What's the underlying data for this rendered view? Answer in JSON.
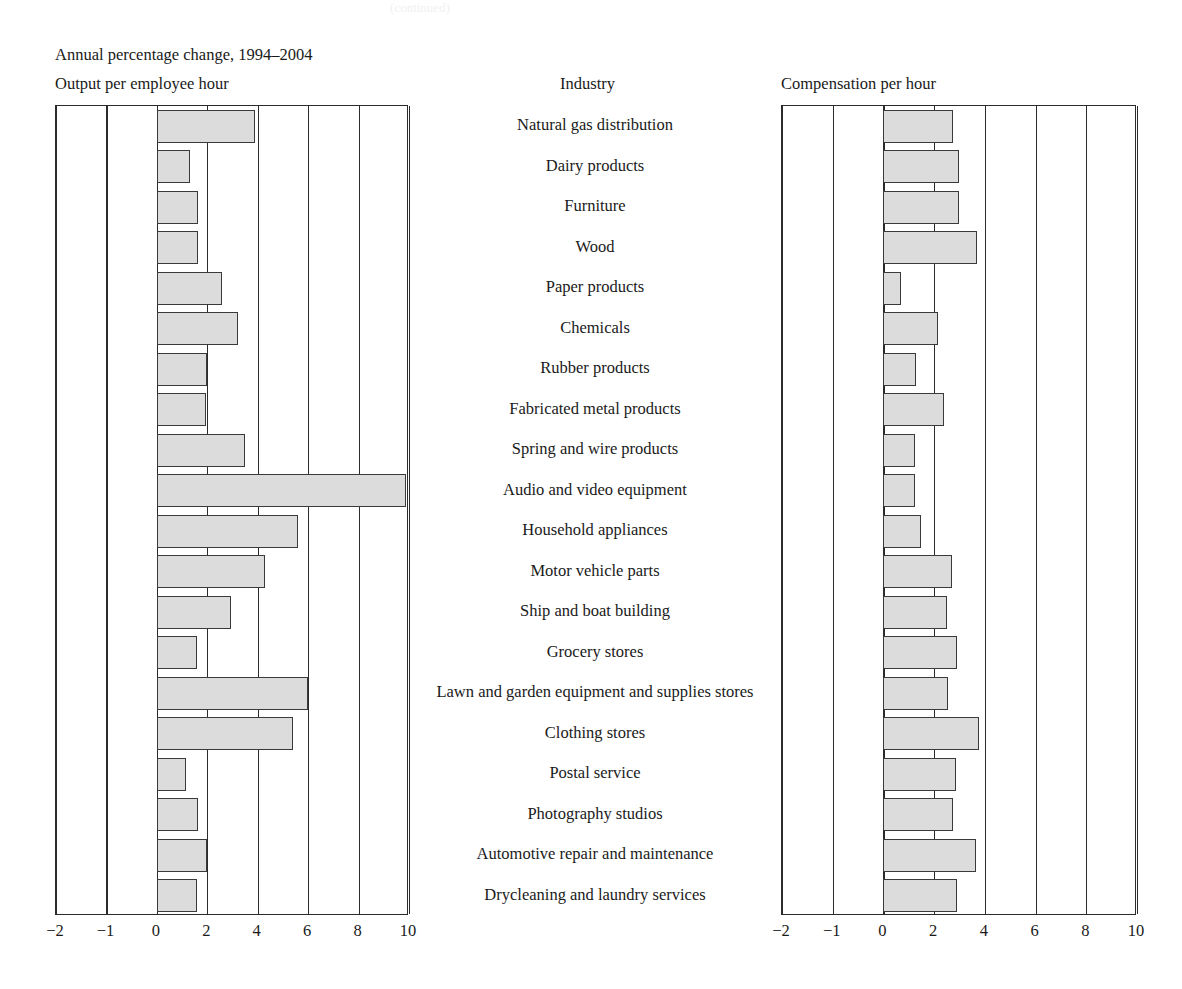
{
  "top_cut_text": "(continued)",
  "headings": {
    "subtitle": "Annual percentage change, 1994–2004",
    "left_column": "Output per employee hour",
    "middle_column": "Industry",
    "right_column": "Compensation per hour"
  },
  "axis": {
    "ticks": [
      "−2",
      "−1",
      "0",
      "2",
      "4",
      "6",
      "8",
      "10"
    ],
    "tick_values": [
      -2,
      -1,
      0,
      2,
      4,
      6,
      8,
      10
    ],
    "min": -2,
    "max": 10
  },
  "style": {
    "bar_fill": "#dcdcdc",
    "bar_border": "#3a3a3a",
    "frame": "#2b2b2b",
    "background": "#ffffff"
  },
  "chart_data": {
    "type": "bar",
    "title": "Annual percentage change, 1994–2004",
    "orientation": "horizontal",
    "grid": true,
    "legend": "none",
    "xlabel": "",
    "ylabel": "Industry",
    "xlim": [
      -2,
      10
    ],
    "xticks": [
      -2,
      -1,
      0,
      2,
      4,
      6,
      8,
      10
    ],
    "categories": [
      "Natural gas distribution",
      "Dairy products",
      "Furniture",
      "Wood",
      "Paper products",
      "Chemicals",
      "Rubber products",
      "Fabricated metal products",
      "Spring and wire products",
      "Audio and video equipment",
      "Household appliances",
      "Motor vehicle parts",
      "Ship and boat building",
      "Grocery stores",
      "Lawn and garden equipment and supplies stores",
      "Clothing stores",
      "Postal service",
      "Photography studios",
      "Automotive repair and maintenance",
      "Drycleaning and laundry services"
    ],
    "series": [
      {
        "name": "Output per employee hour",
        "panel": "left",
        "values": [
          3.9,
          1.3,
          1.65,
          1.65,
          2.6,
          3.2,
          2.0,
          1.95,
          3.5,
          9.9,
          5.6,
          4.3,
          2.95,
          1.6,
          6.0,
          5.4,
          1.15,
          1.65,
          2.0,
          1.6
        ]
      },
      {
        "name": "Compensation per hour",
        "panel": "right",
        "values": [
          2.75,
          3.0,
          3.0,
          3.7,
          0.7,
          2.15,
          1.3,
          2.4,
          1.25,
          1.25,
          1.5,
          2.7,
          2.5,
          2.9,
          2.55,
          3.75,
          2.85,
          2.75,
          3.65,
          2.9
        ]
      }
    ]
  }
}
